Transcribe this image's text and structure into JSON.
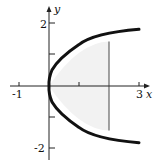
{
  "diagram": {
    "type": "coordinate-plot",
    "curve": "x = y^2 (parabola opening right)",
    "axes": {
      "x_label": "x",
      "y_label": "y",
      "x_ticks": [
        {
          "value": -1,
          "label": "-1"
        },
        {
          "value": 1,
          "label": ""
        },
        {
          "value": 2,
          "label": ""
        },
        {
          "value": 3,
          "label": "3"
        }
      ],
      "y_ticks": [
        {
          "value": 2,
          "label": "2"
        },
        {
          "value": 1,
          "label": ""
        },
        {
          "value": -1,
          "label": ""
        },
        {
          "value": -2,
          "label": "-2"
        }
      ]
    },
    "vertical_line_x": 2,
    "shaded_region": "region between parabola and x = 2",
    "colors": {
      "curve": "#111111",
      "axes": "#222222",
      "shade": "#f2f2f2"
    }
  }
}
